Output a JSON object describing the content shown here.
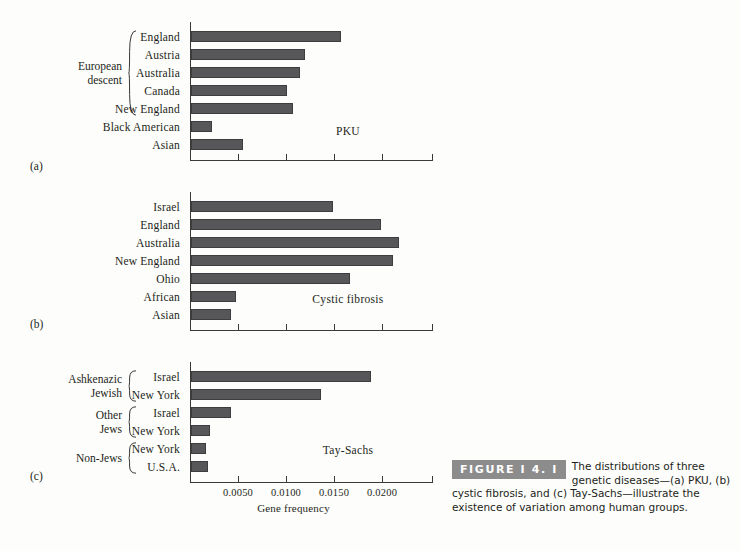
{
  "figure": {
    "badge": "FIGURE  I 4. I",
    "caption": "The distributions of three genetic diseases—(a) PKU, (b) cystic fibrosis, and (c) Tay-Sachs—illustrate the existence of variation among human groups."
  },
  "axis": {
    "title": "Gene frequency",
    "tick_labels": [
      "0.0050",
      "0.0100",
      "0.0150",
      "0.0200"
    ],
    "tick_values": [
      0.005,
      0.01,
      0.015,
      0.02
    ],
    "xmin": 0,
    "xmax": 0.0253
  },
  "panels": [
    {
      "letter": "(a)",
      "disease": "PKU",
      "groups": [
        {
          "label": "European\ndescent",
          "rows": 5
        }
      ],
      "rows": [
        {
          "label": "England",
          "value": 0.0156
        },
        {
          "label": "Austria",
          "value": 0.0119
        },
        {
          "label": "Australia",
          "value": 0.0114
        },
        {
          "label": "Canada",
          "value": 0.01
        },
        {
          "label": "New England",
          "value": 0.0106
        },
        {
          "label": "Black American",
          "value": 0.0022
        },
        {
          "label": "Asian",
          "value": 0.0054
        }
      ]
    },
    {
      "letter": "(b)",
      "disease": "Cystic fibrosis",
      "groups": [],
      "rows": [
        {
          "label": "Israel",
          "value": 0.0148
        },
        {
          "label": "England",
          "value": 0.0198
        },
        {
          "label": "Australia",
          "value": 0.0217
        },
        {
          "label": "New England",
          "value": 0.021
        },
        {
          "label": "Ohio",
          "value": 0.0166
        },
        {
          "label": "African",
          "value": 0.0047
        },
        {
          "label": "Asian",
          "value": 0.0042
        }
      ]
    },
    {
      "letter": "(c)",
      "disease": "Tay-Sachs",
      "groups": [
        {
          "label": "Ashkenazic\nJewish",
          "rows": 2
        },
        {
          "label": "Other\nJews",
          "rows": 2
        },
        {
          "label": "Non-Jews",
          "rows": 2
        }
      ],
      "rows": [
        {
          "label": "Israel",
          "value": 0.0187
        },
        {
          "label": "New York",
          "value": 0.0135
        },
        {
          "label": "Israel",
          "value": 0.0042
        },
        {
          "label": "New York",
          "value": 0.002
        },
        {
          "label": "New York",
          "value": 0.0016
        },
        {
          "label": "U.S.A.",
          "value": 0.0018
        }
      ]
    }
  ],
  "chart_data": {
    "type": "bar",
    "title": "The distributions of three genetic diseases—(a) PKU, (b) cystic fibrosis, and (c) Tay-Sachs—illustrate the existence of variation among human groups.",
    "orientation": "horizontal",
    "xlabel": "Gene frequency",
    "ylabel": "",
    "xlim": [
      0,
      0.0253
    ],
    "xticks": [
      0.005,
      0.01,
      0.015,
      0.02
    ],
    "xticklabels": [
      "0.0050",
      "0.0100",
      "0.0150",
      "0.0200"
    ],
    "grid": false,
    "legend": "none",
    "panels": [
      {
        "panel": "(a)",
        "annotation": "PKU",
        "categories": [
          "England",
          "Austria",
          "Australia",
          "Canada",
          "New England",
          "Black American",
          "Asian"
        ],
        "values": [
          0.0156,
          0.0119,
          0.0114,
          0.01,
          0.0106,
          0.0022,
          0.0054
        ],
        "group_brackets": [
          {
            "label": "European descent",
            "categories": [
              "England",
              "Austria",
              "Australia",
              "Canada",
              "New England"
            ]
          }
        ]
      },
      {
        "panel": "(b)",
        "annotation": "Cystic fibrosis",
        "categories": [
          "Israel",
          "England",
          "Australia",
          "New England",
          "Ohio",
          "African",
          "Asian"
        ],
        "values": [
          0.0148,
          0.0198,
          0.0217,
          0.021,
          0.0166,
          0.0047,
          0.0042
        ],
        "group_brackets": []
      },
      {
        "panel": "(c)",
        "annotation": "Tay-Sachs",
        "categories": [
          "Israel",
          "New York",
          "Israel",
          "New York",
          "New York",
          "U.S.A."
        ],
        "values": [
          0.0187,
          0.0135,
          0.0042,
          0.002,
          0.0016,
          0.0018
        ],
        "group_brackets": [
          {
            "label": "Ashkenazic Jewish",
            "categories": [
              "Israel",
              "New York"
            ]
          },
          {
            "label": "Other Jews",
            "categories": [
              "Israel",
              "New York"
            ]
          },
          {
            "label": "Non-Jews",
            "categories": [
              "New York",
              "U.S.A."
            ]
          }
        ]
      }
    ]
  }
}
